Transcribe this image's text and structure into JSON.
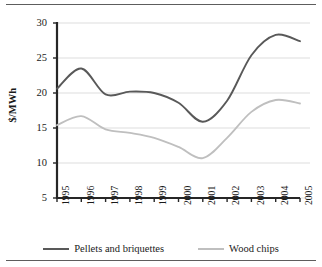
{
  "chart_data": {
    "type": "line",
    "title": "",
    "xlabel": "",
    "ylabel": "$/MWh",
    "x": [
      1995,
      1996,
      1997,
      1998,
      1999,
      2000,
      2001,
      2002,
      2003,
      2004,
      2005
    ],
    "categories": [
      "1995",
      "1996",
      "1997",
      "1998",
      "1999",
      "2000",
      "2001",
      "2002",
      "2003",
      "2004",
      "2005"
    ],
    "xlim": [
      1995,
      2005
    ],
    "ylim": [
      5,
      30
    ],
    "yticks": [
      5,
      10,
      15,
      20,
      25,
      30
    ],
    "ytick_labels": [
      "5",
      "10",
      "15",
      "20",
      "25",
      "30"
    ],
    "grid": "horizontal",
    "legend_position": "bottom",
    "series": [
      {
        "name": "Pellets and briquettes",
        "color": "#595959",
        "values": [
          20.6,
          23.5,
          19.8,
          20.2,
          20.0,
          18.6,
          15.9,
          18.9,
          25.4,
          28.3,
          27.4
        ]
      },
      {
        "name": "Wood chips",
        "color": "#bfbfbf",
        "values": [
          15.4,
          16.7,
          14.8,
          14.3,
          13.6,
          12.3,
          10.7,
          13.6,
          17.3,
          19.0,
          18.5
        ]
      }
    ]
  },
  "axis": {
    "y_title": "$/MWh"
  }
}
